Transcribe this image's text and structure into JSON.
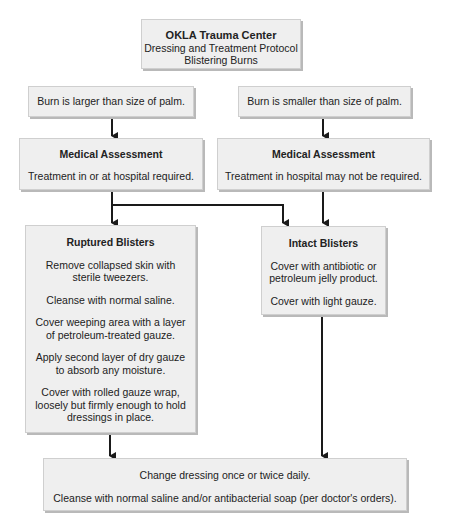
{
  "title": {
    "org": "OKLA Trauma Center",
    "line2": "Dressing and Treatment Protocol",
    "line3": "Blistering Burns"
  },
  "conditions": {
    "left": "Burn is larger than size of palm.",
    "right": "Burn is smaller than size of palm."
  },
  "assessments": {
    "left": {
      "heading": "Medical Assessment",
      "text": "Treatment in or at hospital required."
    },
    "right": {
      "heading": "Medical Assessment",
      "text": "Treatment in hospital may not be required."
    }
  },
  "ruptured": {
    "heading": "Ruptured Blisters",
    "steps": [
      "Remove collapsed skin with sterile tweezers.",
      "Cleanse with normal saline.",
      "Cover weeping area with a layer of petroleum-treated gauze.",
      "Apply second layer of dry gauze to absorb any moisture.",
      "Cover with rolled gauze wrap, loosely but firmly enough to hold dressings in place."
    ]
  },
  "intact": {
    "heading": "Intact Blisters",
    "steps": [
      "Cover with antibiotic or petroleum jelly product.",
      "Cover with light gauze."
    ]
  },
  "final": {
    "steps": [
      "Change dressing once or twice daily.",
      "Cleanse with normal saline and/or antibacterial soap (per doctor's orders)."
    ]
  },
  "colors": {
    "box_fill": "#efefef",
    "box_border": "#cfcfcf",
    "box_shadow": "#b9b9b9",
    "line": "#1a1a1a"
  }
}
